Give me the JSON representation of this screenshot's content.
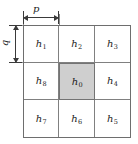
{
  "figure": {
    "type": "neighborhood-grid-diagram",
    "colors": {
      "center_fill": "#cfcfcf",
      "cell_fill": "#ffffff",
      "grid_line": "#808080",
      "outer_border": "#6e6e6e",
      "dimension_line": "#3a3a3a",
      "text": "#1a1a1a"
    }
  },
  "dimensions": {
    "horizontal": {
      "label": "p",
      "orientation": "horizontal",
      "spans": "single-column-width"
    },
    "vertical": {
      "label": "q",
      "orientation": "vertical",
      "spans": "single-row-height"
    }
  },
  "grid": {
    "rows": 3,
    "cols": 3,
    "cells": [
      {
        "base": "h",
        "sub": "1",
        "row": 0,
        "col": 0,
        "shaded": false
      },
      {
        "base": "h",
        "sub": "2",
        "row": 0,
        "col": 1,
        "shaded": false
      },
      {
        "base": "h",
        "sub": "3",
        "row": 0,
        "col": 2,
        "shaded": false
      },
      {
        "base": "h",
        "sub": "8",
        "row": 1,
        "col": 0,
        "shaded": false
      },
      {
        "base": "h",
        "sub": "0",
        "row": 1,
        "col": 1,
        "shaded": true
      },
      {
        "base": "h",
        "sub": "4",
        "row": 1,
        "col": 2,
        "shaded": false
      },
      {
        "base": "h",
        "sub": "7",
        "row": 2,
        "col": 0,
        "shaded": false
      },
      {
        "base": "h",
        "sub": "6",
        "row": 2,
        "col": 1,
        "shaded": false
      },
      {
        "base": "h",
        "sub": "5",
        "row": 2,
        "col": 2,
        "shaded": false
      }
    ]
  }
}
